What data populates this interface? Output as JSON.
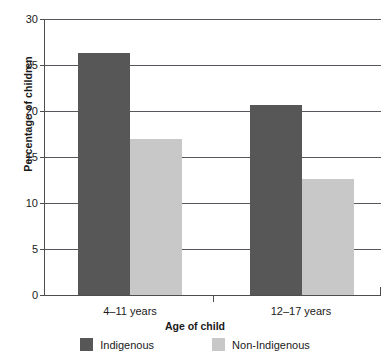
{
  "chart_data": {
    "type": "bar",
    "title": "",
    "xlabel": "Age of child",
    "ylabel": "Percentage of children",
    "categories": [
      "4–11 years",
      "12–17 years"
    ],
    "series": [
      {
        "name": "Indigenous",
        "values": [
          26.3,
          20.7
        ],
        "color": "#575757"
      },
      {
        "name": "Non-Indigenous",
        "values": [
          17.0,
          12.6
        ],
        "color": "#c8c8c8"
      }
    ],
    "ylim": [
      0,
      30
    ],
    "yticks": [
      0,
      5,
      10,
      15,
      20,
      25,
      30
    ],
    "ytick_labels": [
      "0",
      "5",
      "10",
      "15",
      "20",
      "25",
      "30"
    ],
    "grid": true,
    "grid_axis": "y",
    "legend_position": "bottom",
    "bar_width_px": 52,
    "colors": {
      "indigenous": "#575757",
      "non_indigenous": "#c8c8c8",
      "axis": "#4d4d4d",
      "grid": "#55585c",
      "text": "#1a1a1a",
      "background": "#ffffff"
    }
  },
  "axes": {
    "y_title": "Percentage of children",
    "x_title": "Age of child"
  },
  "legend": {
    "items": [
      {
        "label": "Indigenous",
        "color": "#575757"
      },
      {
        "label": "Non-Indigenous",
        "color": "#c8c8c8"
      }
    ]
  }
}
